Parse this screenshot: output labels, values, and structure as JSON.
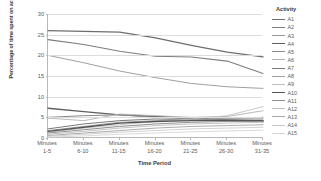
{
  "chart_data": {
    "type": "line",
    "title": "",
    "xlabel": "Time Period",
    "ylabel": "Percentage of time spent on activities",
    "categories": [
      "Minutes 1-5",
      "Minutes 6-10",
      "Minutes 11-15",
      "Minutes 16-20",
      "Minutes 21-25",
      "Minutes 26-30",
      "Minutes 31-35"
    ],
    "category_lines": [
      [
        "Minutes",
        "1-5"
      ],
      [
        "Minutes",
        "6-10"
      ],
      [
        "Minutes",
        "11-15"
      ],
      [
        "Minutes",
        "16-20"
      ],
      [
        "Minutes",
        "21-25"
      ],
      [
        "Minutes",
        "26-30"
      ],
      [
        "Minutes",
        "31-35"
      ]
    ],
    "ylim": [
      0,
      30
    ],
    "yticks": [
      0,
      5,
      10,
      15,
      20,
      25,
      30
    ],
    "grid": true,
    "legend_position": "right",
    "legend_title": "Activity",
    "series": [
      {
        "name": "A1",
        "color": "#6e6e6e",
        "width": 1.25,
        "values": [
          26.0,
          25.8,
          25.6,
          24.2,
          22.4,
          20.8,
          19.6
        ]
      },
      {
        "name": "A2",
        "color": "#7d7d7d",
        "width": 1.05,
        "values": [
          23.8,
          22.6,
          21.0,
          19.8,
          19.6,
          18.6,
          15.6
        ]
      },
      {
        "name": "A3",
        "color": "#9a9a9a",
        "width": 0.95,
        "values": [
          20.0,
          18.2,
          16.2,
          14.6,
          13.2,
          12.4,
          12.0
        ]
      },
      {
        "name": "A4",
        "color": "#5f5f5f",
        "width": 1.35,
        "values": [
          7.2,
          6.4,
          5.6,
          5.2,
          4.8,
          4.4,
          4.0
        ]
      },
      {
        "name": "A5",
        "color": "#8a8a8a",
        "width": 1.0,
        "values": [
          5.0,
          5.4,
          5.6,
          5.0,
          4.6,
          4.4,
          4.2
        ]
      },
      {
        "name": "A6",
        "color": "#b2b2b2",
        "width": 0.9,
        "values": [
          4.8,
          4.2,
          5.8,
          5.4,
          5.0,
          5.2,
          6.6
        ]
      },
      {
        "name": "A7",
        "color": "#7a7a7a",
        "width": 1.0,
        "values": [
          2.2,
          3.4,
          4.2,
          4.6,
          4.4,
          4.6,
          4.6
        ]
      },
      {
        "name": "A8",
        "color": "#a0a0a0",
        "width": 0.95,
        "values": [
          1.8,
          2.8,
          3.8,
          4.2,
          4.4,
          4.8,
          5.0
        ]
      },
      {
        "name": "A9",
        "color": "#c0c0c0",
        "width": 0.85,
        "values": [
          1.4,
          2.4,
          3.2,
          4.0,
          4.6,
          5.4,
          7.6
        ]
      },
      {
        "name": "A10",
        "color": "#555555",
        "width": 1.4,
        "values": [
          1.6,
          2.6,
          3.6,
          4.0,
          4.2,
          4.2,
          4.2
        ]
      },
      {
        "name": "A11",
        "color": "#8f8f8f",
        "width": 1.0,
        "values": [
          1.2,
          2.0,
          2.8,
          3.4,
          3.8,
          4.0,
          4.0
        ]
      },
      {
        "name": "A12",
        "color": "#bdbdbd",
        "width": 0.9,
        "values": [
          0.9,
          1.6,
          2.4,
          3.0,
          3.4,
          3.6,
          3.8
        ]
      },
      {
        "name": "A13",
        "color": "#a8a8a8",
        "width": 0.95,
        "values": [
          0.6,
          1.2,
          1.8,
          2.4,
          2.8,
          3.0,
          3.2
        ]
      },
      {
        "name": "A14",
        "color": "#cacaca",
        "width": 0.85,
        "values": [
          0.4,
          0.9,
          1.4,
          1.8,
          2.2,
          2.4,
          2.6
        ]
      },
      {
        "name": "A15",
        "color": "#d5d5d5",
        "width": 0.85,
        "values": [
          0.2,
          0.5,
          0.9,
          1.2,
          1.5,
          1.7,
          1.9
        ]
      }
    ]
  }
}
